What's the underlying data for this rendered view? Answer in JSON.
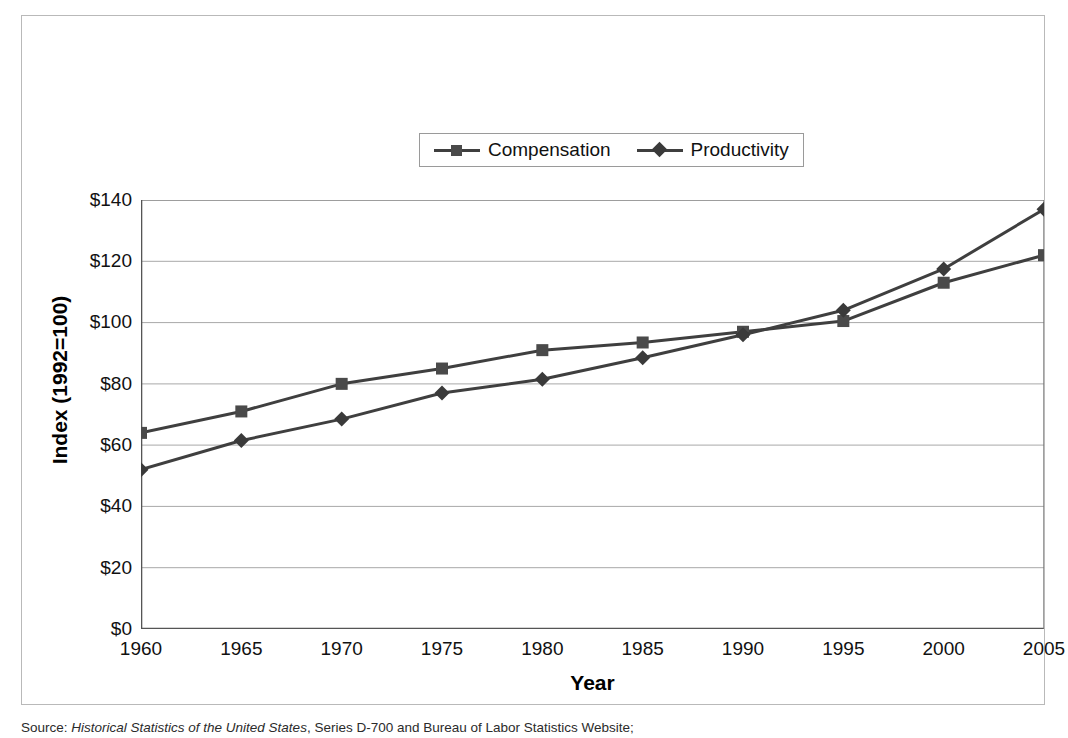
{
  "chart_data": {
    "type": "line",
    "title": "",
    "xlabel": "Year",
    "ylabel": "Index (1992=100)",
    "x": [
      1960,
      1965,
      1970,
      1975,
      1980,
      1985,
      1990,
      1995,
      2000,
      2005
    ],
    "xtick_labels": [
      "1960",
      "1965",
      "1970",
      "1975",
      "1980",
      "1985",
      "1990",
      "1995",
      "2000",
      "2005"
    ],
    "ytick_labels": [
      "$0",
      "$20",
      "$40",
      "$60",
      "$80",
      "$100",
      "$120",
      "$140"
    ],
    "ytick_values": [
      0,
      20,
      40,
      60,
      80,
      100,
      120,
      140
    ],
    "ylim": [
      0,
      140
    ],
    "xlim": [
      1960,
      2005
    ],
    "grid": "horizontal",
    "legend_position": "top-center",
    "series": [
      {
        "name": "Compensation",
        "marker": "square",
        "color": "#4a4a4a",
        "values": [
          64,
          71,
          80,
          85,
          91,
          93.5,
          97,
          100.5,
          113,
          122
        ]
      },
      {
        "name": "Productivity",
        "marker": "diamond",
        "color": "#3a3a3a",
        "values": [
          52,
          61.5,
          68.5,
          77,
          81.5,
          88.5,
          96,
          104,
          117.5,
          137
        ]
      }
    ]
  },
  "legend": {
    "entries": [
      {
        "label": "Compensation",
        "marker": "square-marker"
      },
      {
        "label": "Productivity",
        "marker": "diamond-marker"
      }
    ]
  },
  "axis_titles": {
    "x": "Year",
    "y": "Index (1992=100)"
  },
  "source": {
    "label": "Source: ",
    "italic_part": "Historical Statistics of the United States",
    "rest": ", Series D-700 and Bureau of Labor Statistics Website;"
  },
  "colors": {
    "line": "#3f3f3f",
    "grid": "#9d9d9d",
    "axis": "#555555",
    "frame": "#b9b9b9",
    "background": "#ffffff"
  }
}
